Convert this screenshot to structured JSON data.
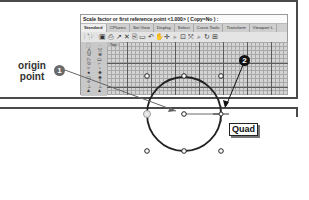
{
  "command_line": {
    "prompt": "Scale factor or first reference point <1.000> ( Copy=No ) :"
  },
  "tabs": [
    {
      "label": "Standard",
      "active": true
    },
    {
      "label": "CPlanes",
      "active": false
    },
    {
      "label": "Set View",
      "active": false
    },
    {
      "label": "Display",
      "active": false
    },
    {
      "label": "Select",
      "active": false
    },
    {
      "label": "Curve Tools",
      "active": false
    },
    {
      "label": "Transform",
      "active": false
    },
    {
      "label": "Viewport L",
      "active": false
    }
  ],
  "toolbar": {
    "icons": [
      {
        "name": "new-icon",
        "glyph": "🗋"
      },
      {
        "name": "open-icon",
        "glyph": "🗁"
      },
      {
        "name": "save-icon",
        "glyph": "▣"
      },
      {
        "name": "print-icon",
        "glyph": "⎙"
      },
      {
        "name": "import-icon",
        "glyph": "↗"
      },
      {
        "name": "cut-icon",
        "glyph": "✕"
      },
      {
        "name": "copy-icon",
        "glyph": "⎘"
      },
      {
        "name": "paste-icon",
        "glyph": "▭"
      },
      {
        "name": "undo-icon",
        "glyph": "↶"
      },
      {
        "name": "pan-icon",
        "glyph": "✋"
      },
      {
        "name": "move-icon",
        "glyph": "✛"
      },
      {
        "name": "zoom-icon",
        "glyph": "⌕"
      },
      {
        "name": "zoom-window-icon",
        "glyph": "⊡"
      },
      {
        "name": "zoom-extents-icon",
        "glyph": "⤧"
      },
      {
        "name": "zoom-selected-icon",
        "glyph": "⌕"
      },
      {
        "name": "rotate-view-icon",
        "glyph": "↻"
      },
      {
        "name": "viewport-layout-icon",
        "glyph": "⊞"
      }
    ]
  },
  "sidebar_tools": [
    "⬚",
    "·",
    "⋀",
    "⤲",
    "⊙",
    "⊕",
    "▷",
    "▭",
    "⊙",
    "⌐",
    "⌗",
    "◔",
    "●",
    "◈",
    "▭",
    "◈",
    "⟡",
    "⟟",
    "⊥",
    "⊥",
    "▲",
    "▲"
  ],
  "viewport": {
    "label": "Top"
  },
  "annotations": {
    "origin_label": "origin point",
    "badge_1": "1",
    "badge_2": "2",
    "snap_tooltip": "Quad"
  }
}
